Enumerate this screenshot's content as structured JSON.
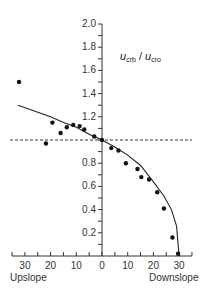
{
  "chart_data": {
    "type": "scatter",
    "title_parts": {
      "num_var": "u",
      "num_sub": "crb",
      "sep": " / ",
      "den_var": "u",
      "den_sub": "cro"
    },
    "xlabel_left": "Upslope",
    "xlabel_right": "Downslope",
    "ylabel": "",
    "xlim": [
      -35,
      35
    ],
    "ylim": [
      0,
      2.0
    ],
    "x_ticks": [
      -30,
      -20,
      -10,
      0,
      10,
      20,
      30
    ],
    "x_tick_labels": [
      "30",
      "20",
      "10",
      "0",
      "10",
      "20",
      "30"
    ],
    "y_ticks": [
      0.2,
      0.4,
      0.6,
      0.8,
      1.0,
      1.2,
      1.4,
      1.6,
      1.8,
      2.0
    ],
    "y_tick_labels": [
      "0.2",
      "0.4",
      "0.6",
      "0.8",
      "",
      "1.2",
      "1.4",
      "1.6",
      "1.8",
      "2.0"
    ],
    "reference_line": {
      "y": 1.0,
      "style": "dashed"
    },
    "grid": false,
    "series": [
      {
        "name": "measured",
        "kind": "scatter",
        "points": [
          [
            -32.3,
            1.5
          ],
          [
            -21.8,
            0.97
          ],
          [
            -19.3,
            1.15
          ],
          [
            -16.1,
            1.06
          ],
          [
            -13.7,
            1.11
          ],
          [
            -11.2,
            1.13
          ],
          [
            -8.7,
            1.12
          ],
          [
            -6.9,
            1.09
          ],
          [
            -3.0,
            1.03
          ],
          [
            0,
            1.0
          ],
          [
            3.6,
            0.93
          ],
          [
            6.4,
            0.91
          ],
          [
            9.3,
            0.8
          ],
          [
            13.8,
            0.75
          ],
          [
            15.3,
            0.68
          ],
          [
            18.3,
            0.66
          ],
          [
            21.5,
            0.55
          ],
          [
            24.1,
            0.41
          ],
          [
            27.4,
            0.16
          ],
          [
            29.6,
            0.02
          ]
        ]
      },
      {
        "name": "fit",
        "kind": "line",
        "points": [
          [
            -32.7,
            1.3
          ],
          [
            -25,
            1.24
          ],
          [
            -20,
            1.2
          ],
          [
            -15,
            1.15
          ],
          [
            -10,
            1.11
          ],
          [
            -5,
            1.05
          ],
          [
            0,
            1.0
          ],
          [
            5,
            0.94
          ],
          [
            10,
            0.87
          ],
          [
            15,
            0.78
          ],
          [
            20,
            0.64
          ],
          [
            24,
            0.52
          ],
          [
            27,
            0.4
          ],
          [
            29,
            0.26
          ],
          [
            30,
            0.0
          ]
        ]
      }
    ]
  }
}
